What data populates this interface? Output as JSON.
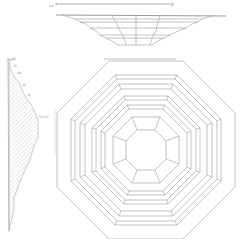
{
  "drawing": {
    "title": "Octagonal stepped dish – elevation, section and plan",
    "views": {
      "top_elevation": {
        "name": "elevation view",
        "dimension_left": "4.0",
        "dimension_right": "1"
      },
      "left_section": {
        "name": "section view",
        "labels": [
          "90",
          "45",
          "40",
          "36",
          "25",
          "52 5 5"
        ]
      },
      "plan": {
        "name": "plan view",
        "rings": 6
      }
    },
    "colors": {
      "line": "#9a9a9a",
      "hatch": "#b0b0b0",
      "background": "#ffffff"
    }
  }
}
